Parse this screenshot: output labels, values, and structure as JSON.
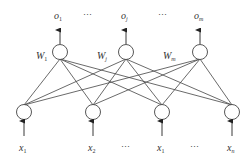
{
  "diagram": {
    "type": "single-layer neural network",
    "outputs": [
      {
        "label": "o",
        "sub": "1",
        "x": 60
      },
      {
        "label": "o",
        "sub": "j",
        "x": 126
      },
      {
        "label": "o",
        "sub": "m",
        "x": 200
      }
    ],
    "output_ellipsis": [
      "⋯",
      "⋯"
    ],
    "weights": [
      {
        "label": "W",
        "sub": "1"
      },
      {
        "label": "W",
        "sub": "j"
      },
      {
        "label": "W",
        "sub": "m"
      }
    ],
    "inputs": [
      {
        "label": "x",
        "sub": "1",
        "x": 24
      },
      {
        "label": "x",
        "sub": "2",
        "x": 93
      },
      {
        "label": "x",
        "sub": "1",
        "x": 162
      },
      {
        "label": "x",
        "sub": "n",
        "x": 232
      }
    ],
    "input_ellipsis": [
      "⋯",
      "⋯"
    ],
    "line_color": "#333333"
  }
}
